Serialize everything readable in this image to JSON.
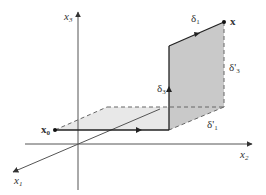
{
  "diagram": {
    "axes": {
      "x1": {
        "label": "x",
        "sub": "1"
      },
      "x2": {
        "label": "x",
        "sub": "2"
      },
      "x3": {
        "label": "x",
        "sub": "3"
      }
    },
    "points": {
      "x0": {
        "label": "x",
        "sub": "0"
      },
      "x": {
        "label": "x"
      }
    },
    "segments": {
      "delta1": {
        "label": "δ",
        "sub": "1"
      },
      "delta3": {
        "label": "δ",
        "sub": "3"
      },
      "delta1_prime": {
        "label": "δ'",
        "sub": "1"
      },
      "delta3_prime": {
        "label": "δ'",
        "sub": "3"
      }
    },
    "colors": {
      "axis": "#555555",
      "path": "#222222",
      "shade_vertical": "#cccccc",
      "shade_floor": "#e6e6e6",
      "dashed": "#666666"
    }
  }
}
